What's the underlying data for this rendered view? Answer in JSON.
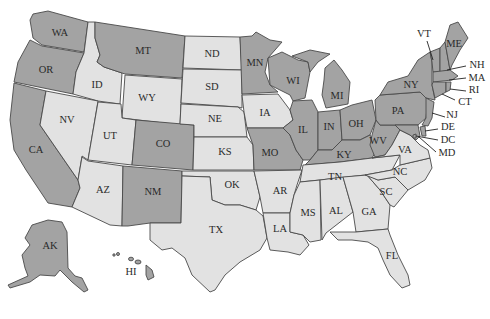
{
  "colors": {
    "highlighted": "#a3a3a3",
    "default": "#e2e2e2",
    "border": "#4a4a4a",
    "label": "#2a2a2a",
    "background": "#ffffff"
  },
  "states": {
    "WA": {
      "label": "WA",
      "group": "highlighted"
    },
    "OR": {
      "label": "OR",
      "group": "highlighted"
    },
    "CA": {
      "label": "CA",
      "group": "highlighted"
    },
    "ID": {
      "label": "ID",
      "group": "default"
    },
    "NV": {
      "label": "NV",
      "group": "default"
    },
    "MT": {
      "label": "MT",
      "group": "highlighted"
    },
    "WY": {
      "label": "WY",
      "group": "default"
    },
    "UT": {
      "label": "UT",
      "group": "default"
    },
    "AZ": {
      "label": "AZ",
      "group": "default"
    },
    "CO": {
      "label": "CO",
      "group": "highlighted"
    },
    "NM": {
      "label": "NM",
      "group": "highlighted"
    },
    "ND": {
      "label": "ND",
      "group": "default"
    },
    "SD": {
      "label": "SD",
      "group": "default"
    },
    "NE": {
      "label": "NE",
      "group": "default"
    },
    "KS": {
      "label": "KS",
      "group": "default"
    },
    "OK": {
      "label": "OK",
      "group": "default"
    },
    "TX": {
      "label": "TX",
      "group": "default"
    },
    "MN": {
      "label": "MN",
      "group": "highlighted"
    },
    "IA": {
      "label": "IA",
      "group": "default"
    },
    "MO": {
      "label": "MO",
      "group": "highlighted"
    },
    "AR": {
      "label": "AR",
      "group": "default"
    },
    "LA": {
      "label": "LA",
      "group": "default"
    },
    "WI": {
      "label": "WI",
      "group": "highlighted"
    },
    "IL": {
      "label": "IL",
      "group": "highlighted"
    },
    "MI": {
      "label": "MI",
      "group": "highlighted"
    },
    "IN": {
      "label": "IN",
      "group": "highlighted"
    },
    "OH": {
      "label": "OH",
      "group": "highlighted"
    },
    "KY": {
      "label": "KY",
      "group": "highlighted"
    },
    "TN": {
      "label": "TN",
      "group": "default"
    },
    "MS": {
      "label": "MS",
      "group": "default"
    },
    "AL": {
      "label": "AL",
      "group": "default"
    },
    "GA": {
      "label": "GA",
      "group": "default"
    },
    "FL": {
      "label": "FL",
      "group": "default"
    },
    "SC": {
      "label": "SC",
      "group": "default"
    },
    "NC": {
      "label": "NC",
      "group": "default"
    },
    "VA": {
      "label": "VA",
      "group": "default"
    },
    "WV": {
      "label": "WV",
      "group": "highlighted"
    },
    "PA": {
      "label": "PA",
      "group": "highlighted"
    },
    "NY": {
      "label": "NY",
      "group": "highlighted"
    },
    "VT": {
      "label": "VT",
      "group": "highlighted"
    },
    "NH": {
      "label": "NH",
      "group": "highlighted"
    },
    "ME": {
      "label": "ME",
      "group": "highlighted"
    },
    "MA": {
      "label": "MA",
      "group": "highlighted"
    },
    "RI": {
      "label": "RI",
      "group": "highlighted"
    },
    "CT": {
      "label": "CT",
      "group": "highlighted"
    },
    "NJ": {
      "label": "NJ",
      "group": "highlighted"
    },
    "DE": {
      "label": "DE",
      "group": "highlighted"
    },
    "DC": {
      "label": "DC",
      "group": "highlighted"
    },
    "MD": {
      "label": "MD",
      "group": "highlighted"
    },
    "AK": {
      "label": "AK",
      "group": "highlighted"
    },
    "HI": {
      "label": "HI",
      "group": "highlighted"
    }
  }
}
